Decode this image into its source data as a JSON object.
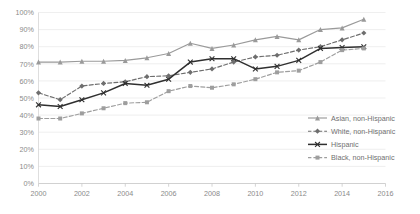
{
  "chart_data": {
    "type": "line",
    "title": "",
    "xlabel": "",
    "ylabel": "",
    "xlim": [
      2000,
      2016
    ],
    "ylim": [
      0,
      100
    ],
    "grid": true,
    "legend_position": "right-inside",
    "x_tick_labels": [
      "2000",
      "2002",
      "2004",
      "2006",
      "2008",
      "2010",
      "2012",
      "2014",
      "2016"
    ],
    "x_ticks": [
      2000,
      2002,
      2004,
      2006,
      2008,
      2010,
      2012,
      2014,
      2016
    ],
    "y_tick_labels": [
      "0%",
      "10%",
      "20%",
      "30%",
      "40%",
      "50%",
      "60%",
      "70%",
      "80%",
      "90%",
      "100%"
    ],
    "y_ticks": [
      0,
      10,
      20,
      30,
      40,
      50,
      60,
      70,
      80,
      90,
      100
    ],
    "x": [
      2000,
      2001,
      2002,
      2003,
      2004,
      2005,
      2006,
      2007,
      2008,
      2009,
      2010,
      2011,
      2012,
      2013,
      2014,
      2015
    ],
    "series": [
      {
        "name": "Asian, non-Hispanic",
        "color": "#9a9a9a",
        "dash": "solid",
        "marker": "triangle",
        "values": [
          71,
          71,
          71.5,
          71.5,
          72,
          73.5,
          76,
          82,
          79,
          81,
          84,
          86,
          84,
          90,
          91,
          96
        ]
      },
      {
        "name": "White, non-Hispanic",
        "color": "#6e6e6e",
        "dash": "dashed",
        "marker": "diamond",
        "values": [
          53,
          49,
          57,
          58.5,
          59.5,
          62.5,
          63,
          65,
          67,
          71,
          74,
          75,
          78,
          80,
          84,
          88
        ]
      },
      {
        "name": "Hispanic",
        "color": "#2f2f2f",
        "dash": "solid",
        "marker": "cross",
        "values": [
          46,
          45,
          49,
          53,
          58.5,
          57.5,
          61,
          71,
          73,
          73,
          67,
          68.5,
          72,
          79,
          79.5,
          80
        ]
      },
      {
        "name": "Black, non-Hispanic",
        "color": "#9e9e9e",
        "dash": "dashed",
        "marker": "square",
        "values": [
          38,
          38,
          41,
          44,
          47,
          47.5,
          54,
          57,
          56,
          58,
          61,
          65,
          66,
          71,
          78,
          79
        ]
      }
    ]
  },
  "legend": {
    "items": [
      {
        "label": "Asian, non-Hispanic"
      },
      {
        "label": "White, non-Hispanic"
      },
      {
        "label": "Hispanic"
      },
      {
        "label": "Black, non-Hispanic"
      }
    ]
  }
}
